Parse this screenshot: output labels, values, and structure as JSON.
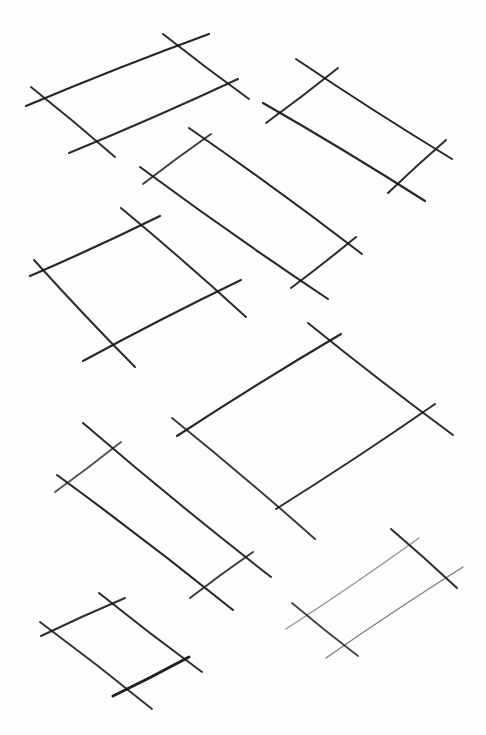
{
  "image": {
    "width": 486,
    "height": 735,
    "background": "#fdfdfd",
    "ink_color": "#151515"
  },
  "sketch": {
    "shapes": [
      {
        "name": "top-left-parallelogram",
        "lines": [
          {
            "x1": 26,
            "y1": 106,
            "x2": 209,
            "y2": 34,
            "w": 2.2,
            "o": 0.92
          },
          {
            "x1": 69,
            "y1": 153,
            "x2": 238,
            "y2": 79,
            "w": 2.0,
            "o": 0.9
          },
          {
            "x1": 31,
            "y1": 87,
            "x2": 115,
            "y2": 157,
            "w": 1.9,
            "o": 0.9
          },
          {
            "x1": 163,
            "y1": 34,
            "x2": 249,
            "y2": 99,
            "w": 2.0,
            "o": 0.9
          }
        ]
      },
      {
        "name": "top-right-parallelogram",
        "lines": [
          {
            "x1": 296,
            "y1": 59,
            "x2": 452,
            "y2": 159,
            "w": 2.0,
            "o": 0.92
          },
          {
            "x1": 263,
            "y1": 103,
            "x2": 425,
            "y2": 201,
            "w": 2.2,
            "o": 0.92
          },
          {
            "x1": 266,
            "y1": 123,
            "x2": 338,
            "y2": 68,
            "w": 2.0,
            "o": 0.9
          },
          {
            "x1": 388,
            "y1": 193,
            "x2": 446,
            "y2": 140,
            "w": 2.0,
            "o": 0.9
          }
        ]
      },
      {
        "name": "middle-long-parallelogram",
        "lines": [
          {
            "x1": 189,
            "y1": 128,
            "x2": 362,
            "y2": 254,
            "w": 2.0,
            "o": 0.92
          },
          {
            "x1": 140,
            "y1": 167,
            "x2": 328,
            "y2": 299,
            "w": 2.1,
            "o": 0.92
          },
          {
            "x1": 143,
            "y1": 184,
            "x2": 211,
            "y2": 134,
            "w": 1.8,
            "o": 0.85
          },
          {
            "x1": 291,
            "y1": 288,
            "x2": 356,
            "y2": 237,
            "w": 2.0,
            "o": 0.9
          }
        ]
      },
      {
        "name": "left-square",
        "lines": [
          {
            "x1": 30,
            "y1": 276,
            "x2": 160,
            "y2": 216,
            "w": 2.2,
            "o": 0.92
          },
          {
            "x1": 83,
            "y1": 361,
            "x2": 241,
            "y2": 280,
            "w": 2.1,
            "o": 0.92
          },
          {
            "x1": 34,
            "y1": 260,
            "x2": 135,
            "y2": 367,
            "w": 2.0,
            "o": 0.9
          },
          {
            "x1": 121,
            "y1": 208,
            "x2": 246,
            "y2": 317,
            "w": 2.0,
            "o": 0.9
          }
        ]
      },
      {
        "name": "center-large-parallelogram",
        "lines": [
          {
            "x1": 177,
            "y1": 436,
            "x2": 341,
            "y2": 334,
            "w": 2.1,
            "o": 0.92
          },
          {
            "x1": 276,
            "y1": 509,
            "x2": 435,
            "y2": 404,
            "w": 2.0,
            "o": 0.9
          },
          {
            "x1": 172,
            "y1": 418,
            "x2": 315,
            "y2": 539,
            "w": 1.9,
            "o": 0.85
          },
          {
            "x1": 308,
            "y1": 323,
            "x2": 453,
            "y2": 435,
            "w": 2.0,
            "o": 0.9
          }
        ]
      },
      {
        "name": "lower-left-long-parallelogram",
        "lines": [
          {
            "x1": 83,
            "y1": 423,
            "x2": 271,
            "y2": 577,
            "w": 2.0,
            "o": 0.9
          },
          {
            "x1": 57,
            "y1": 475,
            "x2": 233,
            "y2": 610,
            "w": 2.1,
            "o": 0.92
          },
          {
            "x1": 55,
            "y1": 492,
            "x2": 121,
            "y2": 442,
            "w": 1.7,
            "o": 0.75
          },
          {
            "x1": 190,
            "y1": 598,
            "x2": 253,
            "y2": 552,
            "w": 1.9,
            "o": 0.85
          }
        ]
      },
      {
        "name": "bottom-left-small-square",
        "lines": [
          {
            "x1": 41,
            "y1": 636,
            "x2": 125,
            "y2": 598,
            "w": 2.0,
            "o": 0.88
          },
          {
            "x1": 113,
            "y1": 696,
            "x2": 189,
            "y2": 657,
            "w": 3.0,
            "o": 0.95
          },
          {
            "x1": 40,
            "y1": 622,
            "x2": 152,
            "y2": 709,
            "w": 1.9,
            "o": 0.88
          },
          {
            "x1": 99,
            "y1": 593,
            "x2": 202,
            "y2": 672,
            "w": 2.0,
            "o": 0.9
          }
        ]
      },
      {
        "name": "bottom-right-faint-parallelogram",
        "lines": [
          {
            "x1": 286,
            "y1": 629,
            "x2": 419,
            "y2": 538,
            "w": 1.4,
            "o": 0.45
          },
          {
            "x1": 326,
            "y1": 658,
            "x2": 463,
            "y2": 567,
            "w": 1.4,
            "o": 0.55
          },
          {
            "x1": 292,
            "y1": 603,
            "x2": 358,
            "y2": 656,
            "w": 1.8,
            "o": 0.8
          },
          {
            "x1": 391,
            "y1": 529,
            "x2": 457,
            "y2": 588,
            "w": 2.0,
            "o": 0.9
          }
        ]
      }
    ]
  }
}
